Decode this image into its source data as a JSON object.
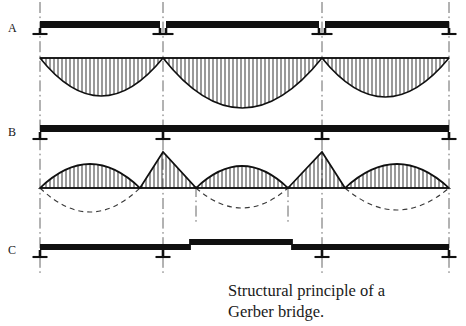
{
  "figure": {
    "title_caption_line1": "Structural principle of a",
    "title_caption_line2": "Gerber bridge.",
    "row_labels": {
      "a": "A",
      "b": "B",
      "c": "C"
    },
    "ink_color": "#101010",
    "dash_color": "#3a3a3a",
    "grid_color": "#555555",
    "background": "#ffffff"
  },
  "chart_data": {
    "type": "line",
    "title": "Structural principle of a Gerber bridge.",
    "xlabel": "",
    "ylabel": "",
    "grid": true,
    "legend_position": "none",
    "xlim": [
      0,
      466
    ],
    "ylim": [
      326,
      0
    ],
    "pier_axes_x": [
      40,
      163,
      322,
      449
    ],
    "secondary_axes_x": [
      196,
      288
    ],
    "panels": [
      {
        "id": "A",
        "label": "A",
        "description": "Series of simply supported single-span beams with joints at every pier",
        "beam_y": 28,
        "beam_thickness": 7,
        "beam_segments": [
          {
            "x1": 40,
            "x2": 160
          },
          {
            "x1": 166,
            "x2": 319
          },
          {
            "x1": 325,
            "x2": 449
          }
        ],
        "supports_x": [
          40,
          160,
          166,
          319,
          325,
          449
        ],
        "moment_baseline_y": 58,
        "moment_sign": "sagging-only",
        "moment_spans": [
          {
            "x1": 40,
            "x2": 163,
            "peak_y": 96,
            "peak_x": 101
          },
          {
            "x1": 163,
            "x2": 322,
            "peak_y": 108,
            "peak_x": 242
          },
          {
            "x1": 322,
            "x2": 449,
            "peak_y": 97,
            "peak_x": 385
          }
        ],
        "hatch": "vertical",
        "hatch_spacing": 4
      },
      {
        "id": "B",
        "label": "B",
        "description": "Continuous beam over all spans; moment diagram alternates sagging (hatched above) and hogging peaks over supports",
        "beam_y": 132,
        "beam_thickness": 7,
        "beam_segments": [
          {
            "x1": 40,
            "x2": 449
          }
        ],
        "supports_x": [
          40,
          163,
          322,
          449
        ],
        "moment_baseline_y": 188,
        "moment_sign": "alternating",
        "hatched_lobes": [
          {
            "type": "parabola",
            "x1": 40,
            "x2": 140,
            "peak_x": 90,
            "peak_y": 164
          },
          {
            "type": "triangle",
            "x1": 140,
            "x2": 196,
            "peak_x": 163,
            "peak_y": 152
          },
          {
            "type": "parabola",
            "x1": 196,
            "x2": 288,
            "peak_x": 242,
            "peak_y": 166
          },
          {
            "type": "triangle",
            "x1": 288,
            "x2": 345,
            "peak_x": 322,
            "peak_y": 152
          },
          {
            "type": "parabola",
            "x1": 345,
            "x2": 449,
            "peak_x": 397,
            "peak_y": 164
          }
        ],
        "dashed_lobes": [
          {
            "x1": 40,
            "x2": 140,
            "trough_x": 90,
            "trough_y": 212
          },
          {
            "x1": 196,
            "x2": 288,
            "trough_x": 242,
            "trough_y": 208
          },
          {
            "x1": 345,
            "x2": 449,
            "trough_x": 397,
            "trough_y": 210
          }
        ],
        "hatch": "vertical",
        "hatch_spacing": 4
      },
      {
        "id": "C",
        "label": "C",
        "description": "Gerber beam: cantilever arms with a dropped-in suspended span between hinges",
        "beam_y": 250,
        "beam_thickness": 6,
        "beam_segments": [
          {
            "x1": 40,
            "x2": 190,
            "offset_y": 0
          },
          {
            "x1": 190,
            "x2": 292,
            "offset_y": -5
          },
          {
            "x1": 292,
            "x2": 449,
            "offset_y": 0
          }
        ],
        "hinges_x": [
          190,
          292
        ],
        "supports_x": [
          40,
          163,
          322,
          449
        ]
      }
    ]
  }
}
